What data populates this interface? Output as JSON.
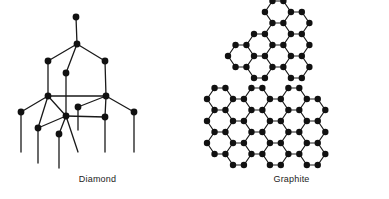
{
  "figure": {
    "background_color": "#ffffff",
    "bond_color": "#1a1a1a",
    "atom_color": "#111111",
    "width": 389,
    "height": 199
  },
  "panels": [
    {
      "id": "diamond",
      "caption": "Diamond",
      "description": "Three-dimensional tetrahedral carbon lattice with dangling bonds",
      "atom_count": 14
    },
    {
      "id": "graphite",
      "caption": "Graphite",
      "description": "Two stacked planar hexagonal carbon layers",
      "layer_count": 2
    }
  ],
  "chart_data": {
    "type": "diagram",
    "diagrams": [
      {
        "name": "Diamond",
        "label": "Diamond",
        "label_position": {
          "x": 86,
          "y": 179
        },
        "atom_radius": 3.4,
        "bond_width": 1.3,
        "atoms": [
          {
            "id": "d0",
            "x": 76,
            "y": 17
          },
          {
            "id": "d1",
            "x": 77,
            "y": 44
          },
          {
            "id": "d2",
            "x": 48,
            "y": 61
          },
          {
            "id": "d3",
            "x": 105,
            "y": 61
          },
          {
            "id": "d4",
            "x": 66,
            "y": 73
          },
          {
            "id": "d5",
            "x": 48,
            "y": 96
          },
          {
            "id": "d6",
            "x": 106,
            "y": 96
          },
          {
            "id": "d7",
            "x": 78,
            "y": 107
          },
          {
            "id": "d8",
            "x": 66,
            "y": 116
          },
          {
            "id": "d9",
            "x": 105,
            "y": 117
          },
          {
            "id": "d10",
            "x": 21,
            "y": 112
          },
          {
            "id": "d11",
            "x": 134,
            "y": 112
          },
          {
            "id": "d12",
            "x": 38,
            "y": 128
          },
          {
            "id": "d13",
            "x": 59,
            "y": 134
          }
        ],
        "bonds": [
          [
            "d0",
            "d1"
          ],
          [
            "d1",
            "d2"
          ],
          [
            "d1",
            "d3"
          ],
          [
            "d1",
            "d4"
          ],
          [
            "d2",
            "d5"
          ],
          [
            "d3",
            "d6"
          ],
          [
            "d4",
            "d8"
          ],
          [
            "d5",
            "d6"
          ],
          [
            "d5",
            "d12"
          ],
          [
            "d5",
            "d8"
          ],
          [
            "d6",
            "d7"
          ],
          [
            "d6",
            "d9"
          ],
          [
            "d6",
            "d11"
          ],
          [
            "d8",
            "d9"
          ],
          [
            "d8",
            "d12"
          ],
          [
            "d8",
            "d13"
          ],
          [
            "d10",
            "d5"
          ]
        ],
        "dangling_bonds": [
          {
            "from": "d10",
            "x2": 21,
            "y2": 152
          },
          {
            "from": "d12",
            "x2": 38,
            "y2": 163
          },
          {
            "from": "d13",
            "x2": 59,
            "y2": 168
          },
          {
            "from": "d8",
            "x2": 78,
            "y2": 152
          },
          {
            "from": "d7",
            "x2": 78,
            "y2": 130
          },
          {
            "from": "d9",
            "x2": 105,
            "y2": 152
          },
          {
            "from": "d11",
            "x2": 134,
            "y2": 152
          }
        ]
      },
      {
        "name": "Graphite",
        "label": "Graphite",
        "label_position": {
          "x": 303,
          "y": 179
        },
        "atom_radius": 3.2,
        "bond_width": 1.2,
        "layers": [
          {
            "name": "upper-layer",
            "origin": {
              "x": 228,
              "y": 12
            },
            "cell_width": 26,
            "cell_height": 22,
            "flat_ratio": 0.42,
            "columns": 4,
            "rows": 3,
            "shape": "stepped-parallelogram",
            "cells": [
              {
                "col": 2,
                "row": 0
              },
              {
                "col": 3,
                "row": 0
              },
              {
                "col": 1,
                "row": 1
              },
              {
                "col": 2,
                "row": 1
              },
              {
                "col": 3,
                "row": 1
              },
              {
                "col": 0,
                "row": 2
              },
              {
                "col": 1,
                "row": 2
              },
              {
                "col": 2,
                "row": 2
              },
              {
                "col": 3,
                "row": 2
              }
            ]
          },
          {
            "name": "lower-layer",
            "origin": {
              "x": 207,
              "y": 99
            },
            "cell_width": 26,
            "cell_height": 22,
            "flat_ratio": 0.42,
            "columns": 6,
            "rows": 3,
            "shape": "full-rectangle",
            "cells": [
              {
                "col": 0,
                "row": 0
              },
              {
                "col": 1,
                "row": 0
              },
              {
                "col": 2,
                "row": 0
              },
              {
                "col": 3,
                "row": 0
              },
              {
                "col": 4,
                "row": 0
              },
              {
                "col": 5,
                "row": 0
              },
              {
                "col": 0,
                "row": 1
              },
              {
                "col": 1,
                "row": 1
              },
              {
                "col": 2,
                "row": 1
              },
              {
                "col": 3,
                "row": 1
              },
              {
                "col": 4,
                "row": 1
              },
              {
                "col": 5,
                "row": 1
              },
              {
                "col": 0,
                "row": 2
              },
              {
                "col": 1,
                "row": 2
              },
              {
                "col": 2,
                "row": 2
              },
              {
                "col": 3,
                "row": 2
              },
              {
                "col": 4,
                "row": 2
              },
              {
                "col": 5,
                "row": 2
              }
            ]
          }
        ]
      }
    ]
  }
}
